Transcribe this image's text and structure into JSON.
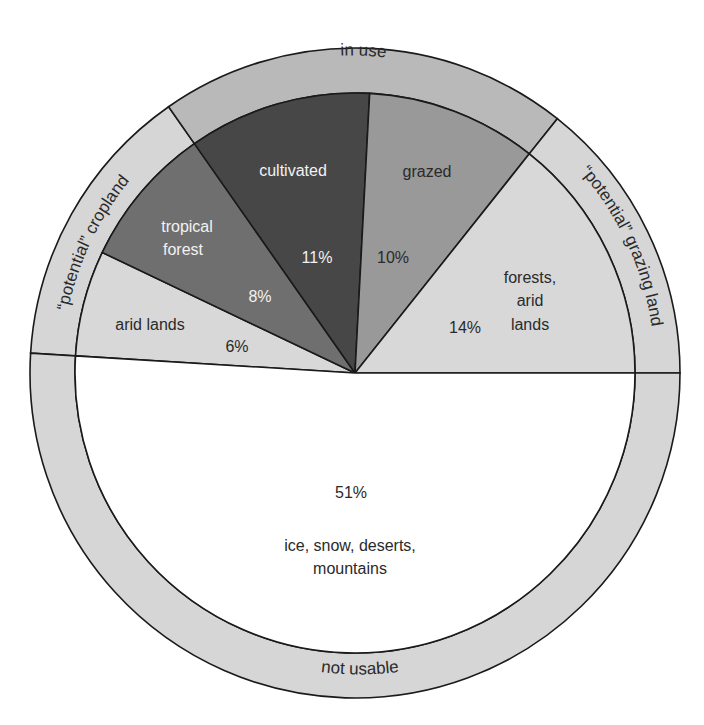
{
  "chart_data": {
    "type": "pie",
    "title": "",
    "center": {
      "x": 355,
      "y": 373
    },
    "inner_radius": 280,
    "outer_radius": 325,
    "slices": [
      {
        "id": "arid-lands",
        "label": "arid lands",
        "value": 6,
        "value_label": "6%",
        "start_angle": 183.5,
        "end_angle": 205.5,
        "color": "#d8d8d8",
        "text_color": "#2a2a2a",
        "group": "potential-cropland"
      },
      {
        "id": "tropical-forest",
        "label": "tropical forest",
        "label_lines": [
          "tropical",
          "forest"
        ],
        "value": 8,
        "value_label": "8%",
        "start_angle": 205.5,
        "end_angle": 235,
        "color": "#6f6f6f",
        "text_color": "#f2f2f2",
        "group": "potential-cropland"
      },
      {
        "id": "cultivated",
        "label": "cultivated",
        "value": 11,
        "value_label": "11%",
        "start_angle": 235,
        "end_angle": 273,
        "color": "#474747",
        "text_color": "#f2f2f2",
        "group": "in-use"
      },
      {
        "id": "grazed",
        "label": "grazed",
        "value": 10,
        "value_label": "10%",
        "start_angle": 273,
        "end_angle": 308.5,
        "color": "#999999",
        "text_color": "#2a2a2a",
        "group": "in-use"
      },
      {
        "id": "forests-arid-lands",
        "label": "forests, arid lands",
        "label_lines": [
          "forests,",
          "arid",
          "lands"
        ],
        "value": 14,
        "value_label": "14%",
        "start_angle": 308.5,
        "end_angle": 360,
        "color": "#d8d8d8",
        "text_color": "#2a2a2a",
        "group": "potential-grazing-land"
      },
      {
        "id": "ice-snow-deserts-mountains",
        "label": "ice, snow, deserts, mountains",
        "label_lines": [
          "ice, snow, deserts,",
          "mountains"
        ],
        "value": 51,
        "value_label": "51%",
        "start_angle": 0,
        "end_angle": 183.5,
        "color": "#ffffff",
        "text_color": "#2a2a2a",
        "group": "not-usable"
      }
    ],
    "outer_ring_groups": [
      {
        "id": "potential-cropland",
        "label": "“potential” cropland",
        "start_angle": 183.5,
        "end_angle": 235,
        "color": "#d6d6d6"
      },
      {
        "id": "in-use",
        "label": "in use",
        "start_angle": 235,
        "end_angle": 308.5,
        "color": "#b9b9b9"
      },
      {
        "id": "potential-grazing-land",
        "label": "“potential” grazing land",
        "start_angle": 308.5,
        "end_angle": 360,
        "color": "#d6d6d6"
      },
      {
        "id": "not-usable",
        "label": "not usable",
        "start_angle": 0,
        "end_angle": 183.5,
        "color": "#d6d6d6"
      }
    ],
    "categories": [
      "arid lands",
      "tropical forest",
      "cultivated",
      "grazed",
      "forests, arid lands",
      "ice, snow, deserts, mountains"
    ],
    "values": [
      6,
      8,
      11,
      10,
      14,
      51
    ],
    "legend": "none",
    "stroke_color": "#1a1a1a"
  },
  "labels": {
    "ring_in_use": "in use",
    "ring_potential_cropland": "“potential” cropland",
    "ring_potential_grazing": "“potential” grazing land",
    "ring_not_usable": "not usable",
    "arid_lands": "arid lands",
    "arid_lands_pct": "6%",
    "tropical_1": "tropical",
    "tropical_2": "forest",
    "tropical_pct": "8%",
    "cultivated": "cultivated",
    "cultivated_pct": "11%",
    "grazed": "grazed",
    "grazed_pct": "10%",
    "forests_1": "forests,",
    "forests_2": "arid",
    "forests_3": "lands",
    "forests_pct": "14%",
    "unusable_pct": "51%",
    "unusable_1": "ice, snow, deserts,",
    "unusable_2": "mountains"
  }
}
